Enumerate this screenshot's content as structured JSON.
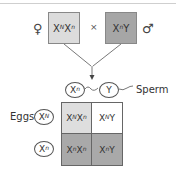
{
  "parents": {
    "female_symbol": "♀",
    "male_symbol": "♂",
    "cross_symbol": "×",
    "female": {
      "base1": "X",
      "sup1": "N",
      "base2": "X",
      "sup2": "n",
      "color": "#dcdcdc"
    },
    "male": {
      "base1": "X",
      "sup1": "n",
      "base2": "Y",
      "color": "#a6a6a6"
    }
  },
  "sperm": {
    "label": "Sperm",
    "gametes": [
      {
        "base": "X",
        "sup": "n"
      },
      {
        "base": "Y",
        "sup": ""
      }
    ]
  },
  "eggs": {
    "label": "Eggs",
    "gametes": [
      {
        "base": "X",
        "sup": "N"
      },
      {
        "base": "X",
        "sup": "n"
      }
    ]
  },
  "punnett": {
    "cells": [
      {
        "b1": "X",
        "s1": "N",
        "b2": "X",
        "s2": "n",
        "color": "#dedede"
      },
      {
        "b1": "X",
        "s1": "N",
        "b2": "Y",
        "s2": "",
        "color": "#ffffff"
      },
      {
        "b1": "X",
        "s1": "n",
        "b2": "X",
        "s2": "n",
        "color": "#a9a9a9"
      },
      {
        "b1": "X",
        "s1": "n",
        "b2": "Y",
        "s2": "",
        "color": "#a9a9a9"
      }
    ]
  }
}
